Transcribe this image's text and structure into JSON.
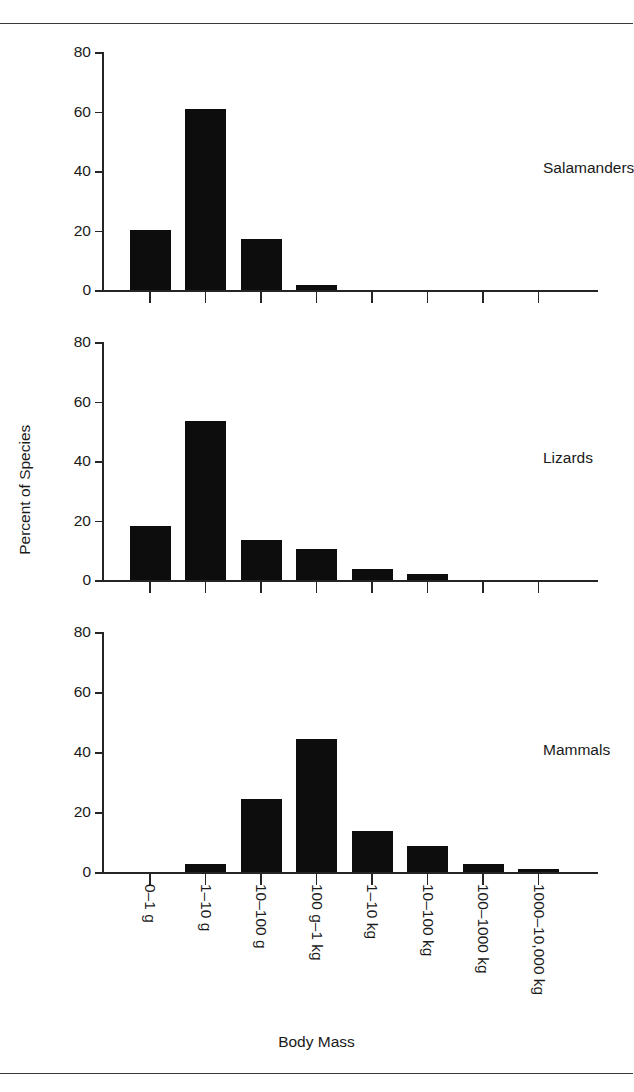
{
  "figure": {
    "xaxis_title": "Body Mass",
    "yaxis_title": "Percent of Species"
  },
  "chart_data": {
    "type": "bar",
    "title": "",
    "xlabel": "Body Mass",
    "ylabel": "Percent of Species",
    "ylim": [
      0,
      80
    ],
    "yticks": [
      0,
      20,
      40,
      60,
      80
    ],
    "ytick_labels": [
      "0",
      "20",
      "40",
      "60",
      "80"
    ],
    "grid": false,
    "legend": "none",
    "panel_layout": "3 stacked panels sharing one x axis",
    "categories": [
      "0–1 g",
      "1–10 g",
      "10–100 g",
      "100 g–1 kg",
      "1–10 kg",
      "10–100 kg",
      "100–1000 kg",
      "1000–10,000 kg"
    ],
    "series": [
      {
        "name": "Salamanders",
        "values": [
          20.3,
          61.0,
          17.3,
          1.7,
          0,
          0,
          0,
          0
        ]
      },
      {
        "name": "Lizards",
        "values": [
          18.3,
          53.3,
          13.5,
          10.5,
          3.7,
          1.9,
          0,
          0
        ]
      },
      {
        "name": "Mammals",
        "values": [
          0,
          2.6,
          24.5,
          44.5,
          13.7,
          8.8,
          2.6,
          0.9
        ]
      }
    ],
    "bar_color": "#0d0d0d",
    "axis_color": "#252525"
  }
}
